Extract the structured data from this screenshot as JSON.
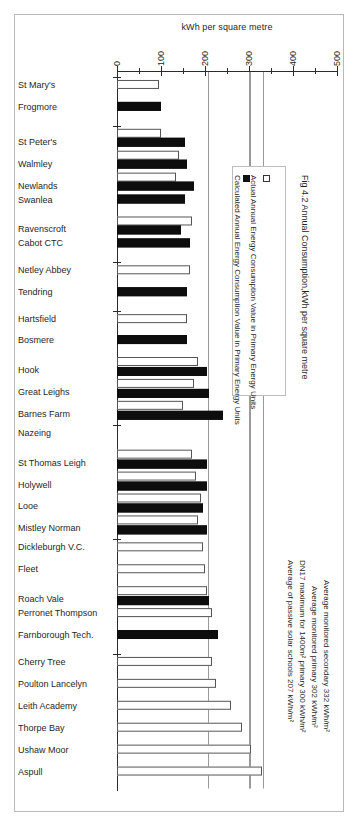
{
  "figure": {
    "title": "Fig 4.2 Annual Consumption,kWh per square metre",
    "axis_title": "kWh per square metre"
  },
  "legend": {
    "items": [
      {
        "key": "actual",
        "label": "Actual Annual Energy Consumption Value in Primary Energy Units",
        "swatch": "hollow-square-icon"
      },
      {
        "key": "calculated",
        "label": "Calculated Annual Energy Consumption Value in Primary Energy Units",
        "swatch": "filled-square-icon"
      }
    ]
  },
  "annotations": [
    {
      "id": "avg-secondary",
      "text": "Average monitored secondary 332 kWh/m²",
      "value": 332
    },
    {
      "id": "avg-primary",
      "text": "Average monitored primary 302 kWh/m²",
      "value": 302
    },
    {
      "id": "dn17-max",
      "text": "DN17 maximum for 1400m² primary 300 kWh/m²",
      "value": 300
    },
    {
      "id": "passive-solar",
      "text": "Average of passive solar schools 207 kWh/m²",
      "value": 207
    }
  ],
  "chart_data": {
    "type": "bar",
    "orientation": "horizontal",
    "title": "Fig 4.2 Annual Consumption,kWh per square metre",
    "xlabel": "kWh per square metre",
    "ylabel": "",
    "xlim": [
      0,
      500
    ],
    "xticks": [
      0,
      100,
      200,
      300,
      400,
      500
    ],
    "xtick_labels": [
      "0",
      "100",
      "200",
      "300",
      "400",
      "500"
    ],
    "minor_tick_step": 50,
    "grid": false,
    "legend_position": "right",
    "reference_lines": [
      {
        "label": "Average of passive solar schools 207 kWh/m²",
        "value": 207
      },
      {
        "label": "DN17 maximum for 1400m² primary 300 kWh/m²",
        "value": 300
      },
      {
        "label": "Average monitored primary 302 kWh/m²",
        "value": 302
      },
      {
        "label": "Average monitored secondary 332 kWh/m²",
        "value": 332
      }
    ],
    "categories": [
      "St Mary's",
      "Frogmore",
      "St Peter's",
      "Walmley",
      "Newlands",
      "Swanlea",
      "Ravenscroft",
      "Cabot CTC",
      "Netley Abbey",
      "Tendring",
      "Hartsfield",
      "Bosmere",
      "Hook",
      "Great Leighs",
      "Barnes Farm",
      "Nazeing",
      "St Thomas Leigh",
      "Holywell",
      "Looe",
      "Mistley Norman",
      "Dickleburgh V.C.",
      "Fleet",
      "Roach Vale",
      "Perronet Thompson",
      "Farnborough Tech.",
      "Cherry Tree",
      "Poulton Lancelyn",
      "Leith Academy",
      "Thorpe Bay",
      "Ushaw Moor",
      "Aspull"
    ],
    "series": [
      {
        "name": "Actual Annual Energy Consumption Value in Primary Energy Units",
        "key": "actual",
        "color": "#ffffff",
        "values": [
          95,
          null,
          100,
          140,
          135,
          null,
          170,
          null,
          165,
          null,
          160,
          null,
          185,
          175,
          150,
          null,
          170,
          180,
          190,
          185,
          195,
          200,
          205,
          215,
          null,
          215,
          225,
          260,
          285,
          305,
          330
        ]
      },
      {
        "name": "Calculated Annual Energy Consumption Value in Primary Energy Units",
        "key": "calculated",
        "color": "#0d0d0d",
        "values": [
          null,
          100,
          155,
          160,
          175,
          155,
          145,
          165,
          null,
          160,
          null,
          160,
          205,
          210,
          240,
          null,
          205,
          205,
          195,
          205,
          null,
          null,
          210,
          null,
          230,
          null,
          null,
          null,
          null,
          null,
          null
        ]
      }
    ]
  },
  "group_separators": [
    0,
    2,
    8,
    10,
    15,
    20,
    25
  ]
}
